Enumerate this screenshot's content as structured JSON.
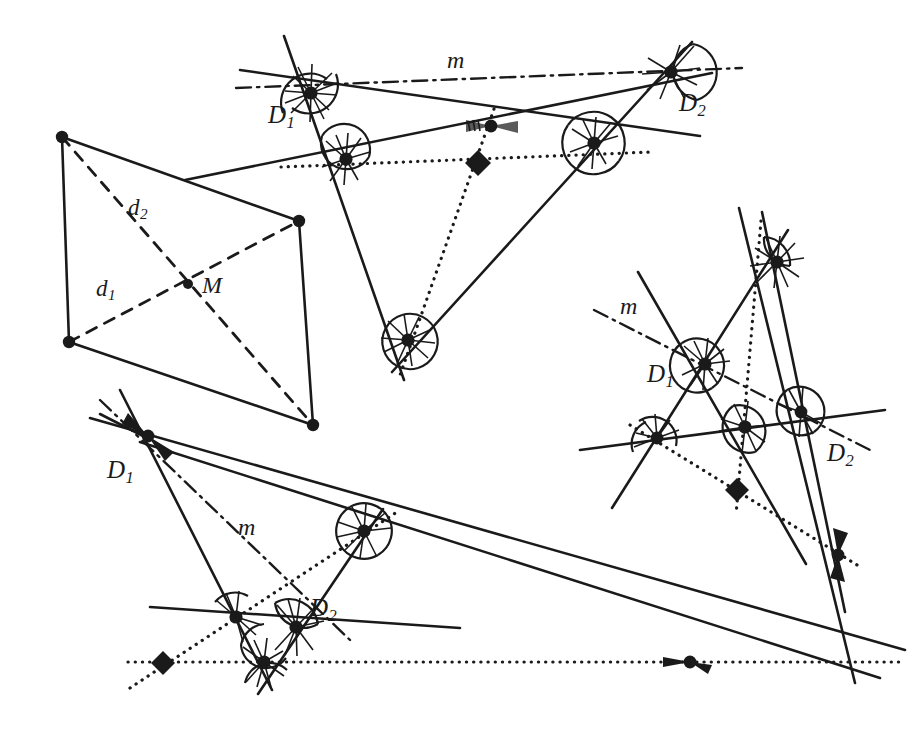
{
  "figure": {
    "type": "geometric-construction",
    "background_color": "#ffffff",
    "stroke_color": "#1a1a1a",
    "panels": [
      {
        "id": "quadrilateral",
        "name": "quadrilateral-with-diagonals",
        "description": "Convex quadrilateral with solid sides and two dashed diagonals meeting at midpoint M",
        "vertices": [
          [
            62,
            137
          ],
          [
            299,
            221
          ],
          [
            313,
            425
          ],
          [
            69,
            342
          ]
        ],
        "diagonals": [
          {
            "label": "d_1",
            "from": [
              69,
              342
            ],
            "to": [
              299,
              221
            ]
          },
          {
            "label": "d_2",
            "from": [
              62,
              137
            ],
            "to": [
              313,
              425
            ]
          }
        ],
        "intersection_point": {
          "label": "M",
          "at": [
            188,
            284
          ]
        },
        "labels": [
          {
            "text": "d",
            "sub": "2",
            "x": 128,
            "y": 196,
            "name": "label-d2"
          },
          {
            "text": "d",
            "sub": "1",
            "x": 96,
            "y": 277,
            "name": "label-d1"
          },
          {
            "text": "M",
            "sub": "",
            "x": 202,
            "y": 273,
            "name": "label-M"
          }
        ]
      },
      {
        "id": "top-center",
        "name": "triangle-construction-top",
        "labels": [
          {
            "text": "m",
            "sub": "",
            "x": 447,
            "y": 48,
            "name": "label-m-top"
          },
          {
            "text": "D",
            "sub": "1",
            "x": 268,
            "y": 102,
            "name": "label-D1-top"
          },
          {
            "text": "D",
            "sub": "2",
            "x": 679,
            "y": 90,
            "name": "label-D2-top"
          }
        ],
        "diamond_marker": [
          478,
          163
        ],
        "line_m_style": "dash-dot"
      },
      {
        "id": "right",
        "name": "triangle-construction-right",
        "labels": [
          {
            "text": "m",
            "sub": "",
            "x": 620,
            "y": 294,
            "name": "label-m-right"
          },
          {
            "text": "D",
            "sub": "1",
            "x": 647,
            "y": 361,
            "name": "label-D1-right"
          },
          {
            "text": "D",
            "sub": "2",
            "x": 827,
            "y": 440,
            "name": "label-D2-right"
          }
        ],
        "diamond_marker": [
          737,
          490
        ],
        "line_m_style": "dash-dot"
      },
      {
        "id": "bottom",
        "name": "triangle-construction-bottom",
        "labels": [
          {
            "text": "m",
            "sub": "",
            "x": 238,
            "y": 515,
            "name": "label-m-bottom"
          },
          {
            "text": "D",
            "sub": "1",
            "x": 107,
            "y": 457,
            "name": "label-D1-bottom"
          },
          {
            "text": "D",
            "sub": "2",
            "x": 310,
            "y": 595,
            "name": "label-D2-bottom"
          }
        ],
        "diamond_marker": [
          163,
          663
        ],
        "line_m_style": "dash-dot"
      }
    ],
    "legend_symbols": {
      "solid_line": "triangle side / ray",
      "dashed_line": "diagonal",
      "dash_dot_line": "line m",
      "dotted_line": "auxiliary locus",
      "filled_circle": "vertex point",
      "filled_diamond": "special point",
      "hatched_sector": "equal angle marker"
    }
  }
}
